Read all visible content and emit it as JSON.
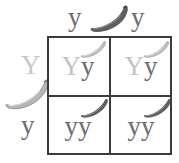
{
  "diagram": {
    "type": "punnett-square",
    "colors": {
      "dominant_allele": "#c2c2c2",
      "recessive_allele": "#6d6d6d",
      "grid_line": "#3b3b3b",
      "banana_dark": "#5f5f5f",
      "banana_light": "#b5b5b5",
      "background": "#ffffff"
    },
    "top_axis": {
      "gamete_labels": [
        "y",
        "y"
      ],
      "parent_icon": "banana-icon-dark",
      "parent_icon_shade": "dark"
    },
    "left_axis": {
      "gamete_labels": [
        "Y",
        "y"
      ],
      "parent_icon": "banana-icon-light",
      "parent_icon_shade": "light"
    },
    "cells": [
      {
        "row": 0,
        "col": 0,
        "first_allele": "Y",
        "second_allele": "y",
        "genotype": "Yy",
        "phenotype_icon": "banana-icon-light",
        "phenotype_shade": "light"
      },
      {
        "row": 0,
        "col": 1,
        "first_allele": "Y",
        "second_allele": "y",
        "genotype": "Yy",
        "phenotype_icon": "banana-icon-light",
        "phenotype_shade": "light"
      },
      {
        "row": 1,
        "col": 0,
        "first_allele": "y",
        "second_allele": "y",
        "genotype": "yy",
        "phenotype_icon": "banana-icon-dark",
        "phenotype_shade": "dark"
      },
      {
        "row": 1,
        "col": 1,
        "first_allele": "y",
        "second_allele": "y",
        "genotype": "yy",
        "phenotype_icon": "banana-icon-dark",
        "phenotype_shade": "dark"
      }
    ]
  }
}
